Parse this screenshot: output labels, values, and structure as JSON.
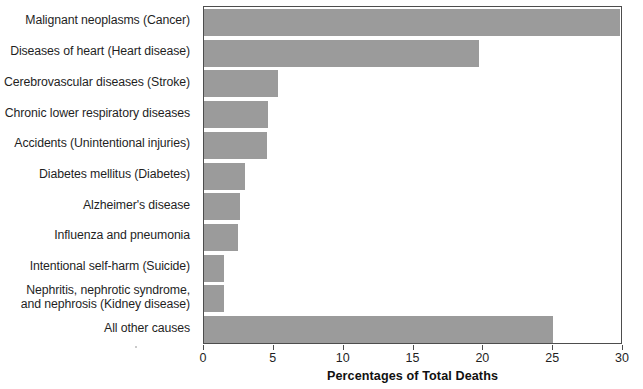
{
  "chart_data": {
    "type": "bar",
    "orientation": "horizontal",
    "title": "",
    "xlabel": "Percentages of Total Deaths",
    "ylabel": "",
    "xlim": [
      0,
      30
    ],
    "xticks": [
      0,
      5,
      10,
      15,
      20,
      25,
      30
    ],
    "xtick_labels": [
      "0",
      "5",
      "10",
      "15",
      "20",
      "25",
      "30"
    ],
    "grid": false,
    "legend": false,
    "bar_color": "#9b9b9b",
    "axis_color": "#4d4d4d",
    "background_color": "#ffffff",
    "categories": [
      "Malignant neoplasms (Cancer)",
      "Diseases of heart (Heart disease)",
      "Cerebrovascular diseases (Stroke)",
      "Chronic lower respiratory diseases",
      "Accidents (Unintentional injuries)",
      "Diabetes mellitus (Diabetes)",
      "Alzheimer's disease",
      "Influenza and pneumonia",
      "Intentional self-harm (Suicide)",
      "Nephritis, nephrotic syndrome,\nand nephrosis (Kidney disease)",
      "All other causes"
    ],
    "values": [
      29.8,
      19.7,
      5.3,
      4.6,
      4.5,
      2.9,
      2.6,
      2.4,
      1.4,
      1.4,
      25.0
    ]
  }
}
